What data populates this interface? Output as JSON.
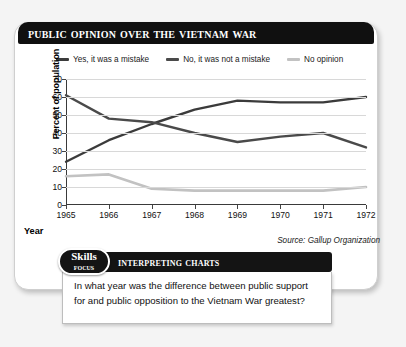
{
  "figure": {
    "title": "Public Opinion Over the Vietnam War",
    "source": "Source: Gallup Organization"
  },
  "chart_data": {
    "type": "line",
    "title": "Public Opinion Over the Vietnam War",
    "xlabel": "Year",
    "ylabel": "Percent of population",
    "categories": [
      "1965",
      "1966",
      "1967",
      "1968",
      "1969",
      "1970",
      "1971",
      "1972"
    ],
    "x": [
      1965,
      1966,
      1967,
      1968,
      1969,
      1970,
      1971,
      1972
    ],
    "xlim": [
      1965,
      1972
    ],
    "ylim": [
      0,
      70
    ],
    "yticks": [
      0,
      10,
      20,
      30,
      40,
      50,
      60,
      70
    ],
    "grid": true,
    "legend_position": "top",
    "series": [
      {
        "name": "Yes, it was a mistake",
        "color": "#3b3b3b",
        "values": [
          24,
          36,
          45,
          53,
          58,
          57,
          57,
          60
        ]
      },
      {
        "name": "No, it was not a mistake",
        "color": "#4a4a4a",
        "values": [
          61,
          48,
          46,
          40,
          35,
          38,
          40,
          32
        ]
      },
      {
        "name": "No opinion",
        "color": "#c2c2c2",
        "values": [
          16,
          17,
          9,
          8,
          8,
          8,
          8,
          10
        ]
      }
    ]
  },
  "skills_focus": {
    "badge_line1": "Skills",
    "badge_line2": "Focus",
    "strip_label": "Interpreting Charts",
    "question": "In what year was the difference between public support for and public opposition to the Vietnam War greatest?"
  }
}
